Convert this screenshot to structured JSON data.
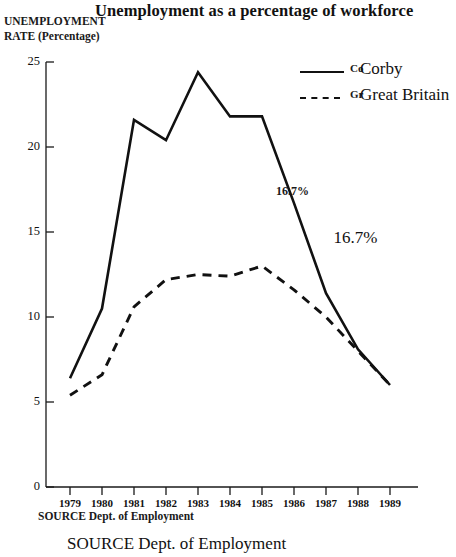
{
  "chart_data": {
    "type": "line",
    "title": "Unemployment as a percentage of workforce",
    "xlabel": "",
    "ylabel": "UNEMPLOYMENT RATE (Percentage)",
    "ylabel_line1": "UNEMPLOYMENT",
    "ylabel_line2": "RATE (Percentage)",
    "categories": [
      "1979",
      "1980",
      "1981",
      "1982",
      "1983",
      "1984",
      "1985",
      "1986",
      "1987",
      "1988",
      "1989"
    ],
    "x": [
      1979,
      1980,
      1981,
      1982,
      1983,
      1984,
      1985,
      1986,
      1987,
      1988,
      1989
    ],
    "xlim": [
      1979,
      1989
    ],
    "ylim": [
      0,
      25
    ],
    "yticks": [
      0,
      5,
      10,
      15,
      20,
      25
    ],
    "ytick_labels": [
      "0",
      "5",
      "10",
      "15",
      "20",
      "25"
    ],
    "grid": false,
    "legend_position": "top-right",
    "series": [
      {
        "name": "Corby",
        "style": "solid",
        "color": "#111111",
        "values": [
          6.4,
          10.5,
          21.6,
          20.4,
          24.4,
          21.8,
          21.8,
          16.7,
          11.4,
          8.1,
          6.0
        ]
      },
      {
        "name": "Great Britain",
        "style": "dashed",
        "color": "#111111",
        "values": [
          5.4,
          6.6,
          10.6,
          12.2,
          12.5,
          12.4,
          13.0,
          11.6,
          10.0,
          8.0,
          6.0
        ]
      }
    ],
    "annotations": [
      {
        "text": "16.7%",
        "x": 1986,
        "y": 17.3,
        "size": "small"
      },
      {
        "text": "16.7%",
        "x": 1987.8,
        "y": 14.7,
        "size": "large"
      }
    ],
    "source_note": "SOURCE Dept. of Employment",
    "source_note_duplicate": "SOURCE Dept. of Employment"
  },
  "legend": {
    "items": [
      {
        "abbrev": "Co",
        "label": "Corby",
        "style": "solid"
      },
      {
        "abbrev": "Gr",
        "label": "Great Britain",
        "style": "dashed"
      }
    ]
  },
  "colors": {
    "ink": "#111111",
    "axis": "#1a1a1a",
    "background": "#ffffff"
  }
}
